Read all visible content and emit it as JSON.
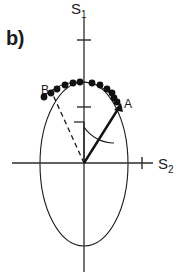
{
  "figure": {
    "panel_label": "b)",
    "background_color": "#ffffff",
    "stroke_color": "#1a1a1a",
    "width": 186,
    "height": 279
  },
  "axes": {
    "vertical": {
      "name": "S1",
      "label_text": "S",
      "label_sub": "1",
      "x": 84,
      "y_top": 18,
      "y_bottom": 272,
      "ticks": [
        {
          "y": 40,
          "half_length": 7
        },
        {
          "y": 107,
          "half_length": 7
        }
      ]
    },
    "horizontal": {
      "name": "S2",
      "label_text": "S",
      "label_sub": "2",
      "y": 163,
      "x_left": 12,
      "x_right": 153,
      "ticks": [
        {
          "x": 142,
          "half_length": 6
        }
      ]
    },
    "origin": {
      "x": 84,
      "y": 163
    }
  },
  "ellipse": {
    "center_x": 84,
    "center_y": 164,
    "radius_x": 44,
    "radius_y": 82,
    "stroke_width": 1.1
  },
  "vector_a": {
    "label": "A",
    "from_x": 84,
    "from_y": 163,
    "to_x": 120,
    "to_y": 106,
    "style": "solid-arrow",
    "stroke_width": 2.2
  },
  "vector_b": {
    "label": "B",
    "from_x": 84,
    "from_y": 163,
    "to_x": 52,
    "to_y": 94,
    "style": "dashed",
    "stroke_width": 1.3
  },
  "reference_line": {
    "description": "short vertical reference from origin upward with end tick",
    "x": 84,
    "y_bottom": 163,
    "y_top": 122,
    "tick_x_end": 74
  },
  "angle_arc": {
    "description": "arc between vertical reference and vector A",
    "center_x": 84,
    "center_y": 163,
    "radius": 36,
    "start_angle_deg": 90,
    "end_angle_deg": 58
  },
  "arc_curve": {
    "description": "thin arc through the data points across the top of the ellipse",
    "stroke_width": 1.0
  },
  "data_points": {
    "count": 13,
    "radius": 3.4,
    "fill": "#111111",
    "coordinates": [
      {
        "x": 44,
        "y": 97
      },
      {
        "x": 51,
        "y": 93
      },
      {
        "x": 57,
        "y": 89
      },
      {
        "x": 65,
        "y": 85
      },
      {
        "x": 73,
        "y": 83
      },
      {
        "x": 80,
        "y": 82
      },
      {
        "x": 92,
        "y": 83
      },
      {
        "x": 100,
        "y": 85
      },
      {
        "x": 107,
        "y": 89
      },
      {
        "x": 112,
        "y": 93
      },
      {
        "x": 113,
        "y": 97
      },
      {
        "x": 117,
        "y": 101
      },
      {
        "x": 120,
        "y": 106
      }
    ]
  }
}
